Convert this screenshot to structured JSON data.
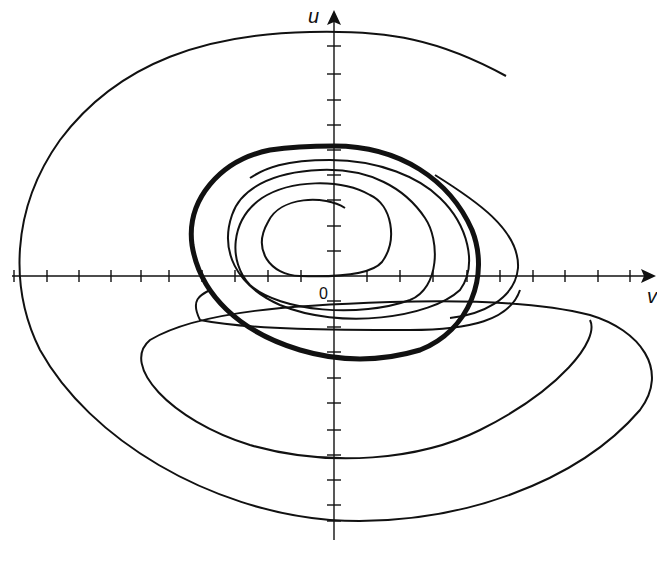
{
  "figure": {
    "type": "phase-portrait",
    "ink_color": "#111111",
    "background": "#ffffff"
  },
  "axes": {
    "horizontal_label": "v",
    "vertical_label": "u",
    "origin_label": "0",
    "origin_px": [
      334,
      276
    ],
    "horizontal_tick_spacing_px": 33,
    "vertical_tick_spacing_px": 25,
    "horizontal_ticks_px": [
      14,
      47,
      79,
      111,
      141,
      169,
      202,
      235,
      268,
      301,
      367,
      400,
      433,
      467,
      500,
      533,
      565,
      598,
      630
    ],
    "vertical_ticks_px": [
      46,
      74,
      100,
      125,
      150,
      175,
      200,
      226,
      251,
      301,
      327,
      352,
      378,
      403,
      430,
      455,
      480,
      505,
      521
    ]
  },
  "curves": [
    {
      "name": "limit-cycle",
      "style": "thick",
      "description": "Stable closed orbit (bold)"
    },
    {
      "name": "inner-spiral",
      "style": "thin",
      "description": "Trajectory starting near origin spiraling outward to the limit cycle"
    },
    {
      "name": "outer-spiral",
      "style": "thin",
      "description": "Trajectory starting far away spiraling inward to the limit cycle"
    }
  ]
}
